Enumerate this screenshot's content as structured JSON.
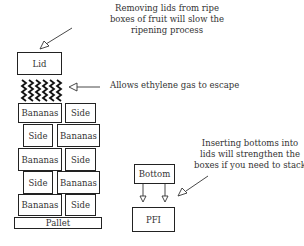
{
  "annotations": {
    "lid_note": [
      "Removing lids from ripe",
      "boxes of fruit will slow the",
      "ripening process"
    ],
    "gas_note": "Allows ethylene gas to escape",
    "stack_note": [
      "Inserting bottoms into",
      "lids will strengthen the",
      "boxes if you need to stack"
    ]
  },
  "stack": {
    "lid": "Lid",
    "rows": [
      [
        "Bananas",
        "Side"
      ],
      [
        "Side",
        "Bananas"
      ],
      [
        "Bananas",
        "Side"
      ],
      [
        "Side",
        "Bananas"
      ],
      [
        "Bananas",
        "Side"
      ]
    ],
    "pallet": "Pallet"
  },
  "insert": {
    "bottom": "Bottom",
    "target": "PFI"
  }
}
